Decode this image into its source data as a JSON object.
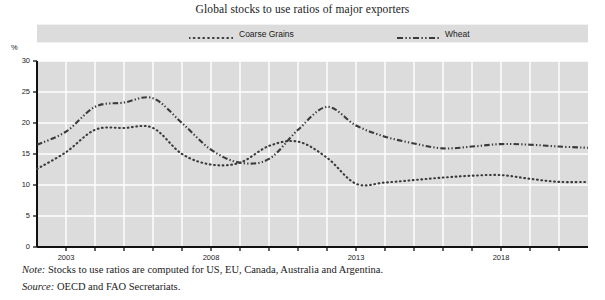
{
  "title": "Global stocks to use ratios of major exporters",
  "y_unit": "%",
  "legend": [
    {
      "label": "Coarse Grains",
      "style": "dotted",
      "name": "legend-coarse-grains"
    },
    {
      "label": "Wheat",
      "style": "dash-dot-dot",
      "name": "legend-wheat"
    }
  ],
  "footnotes": {
    "note_lead": "Note:",
    "note_text": "Stocks to use ratios are computed for US, EU, Canada, Australia and Argentina.",
    "source_lead": "Source:",
    "source_text": "OECD and FAO Secretariats."
  },
  "colors": {
    "plot_background": "#dcdcdc",
    "gridline": "#ffffff",
    "axis": "#111111",
    "series": "#3a3a3a",
    "page_background": "#ffffff"
  },
  "chart_data": {
    "type": "line",
    "title": "Global stocks to use ratios of major exporters",
    "xlabel": "",
    "ylabel": "%",
    "ylim": [
      0,
      30
    ],
    "yticks": [
      0,
      5,
      10,
      15,
      20,
      25,
      30
    ],
    "xlim": [
      2002,
      2021
    ],
    "xticks": [
      2003,
      2008,
      2013,
      2018
    ],
    "xtick_labels": [
      "2003",
      "2008",
      "2013",
      "2018"
    ],
    "grid": true,
    "legend_position": "top",
    "x": [
      2002,
      2003,
      2004,
      2005,
      2006,
      2007,
      2008,
      2009,
      2010,
      2011,
      2012,
      2013,
      2014,
      2015,
      2016,
      2017,
      2018,
      2019,
      2020,
      2021
    ],
    "series": [
      {
        "name": "Coarse Grains",
        "style": "dotted",
        "values": [
          12.6,
          15.3,
          18.9,
          19.2,
          19.2,
          15.0,
          13.3,
          13.6,
          16.3,
          17.0,
          14.4,
          10.2,
          10.4,
          10.8,
          11.2,
          11.5,
          11.6,
          11.0,
          10.5,
          10.5
        ]
      },
      {
        "name": "Wheat",
        "style": "dash-dot-dot",
        "values": [
          16.5,
          18.6,
          22.6,
          23.3,
          24.0,
          20.0,
          15.7,
          13.6,
          14.2,
          18.9,
          22.6,
          19.6,
          17.8,
          16.7,
          15.9,
          16.2,
          16.6,
          16.5,
          16.2,
          16.0
        ]
      }
    ]
  }
}
